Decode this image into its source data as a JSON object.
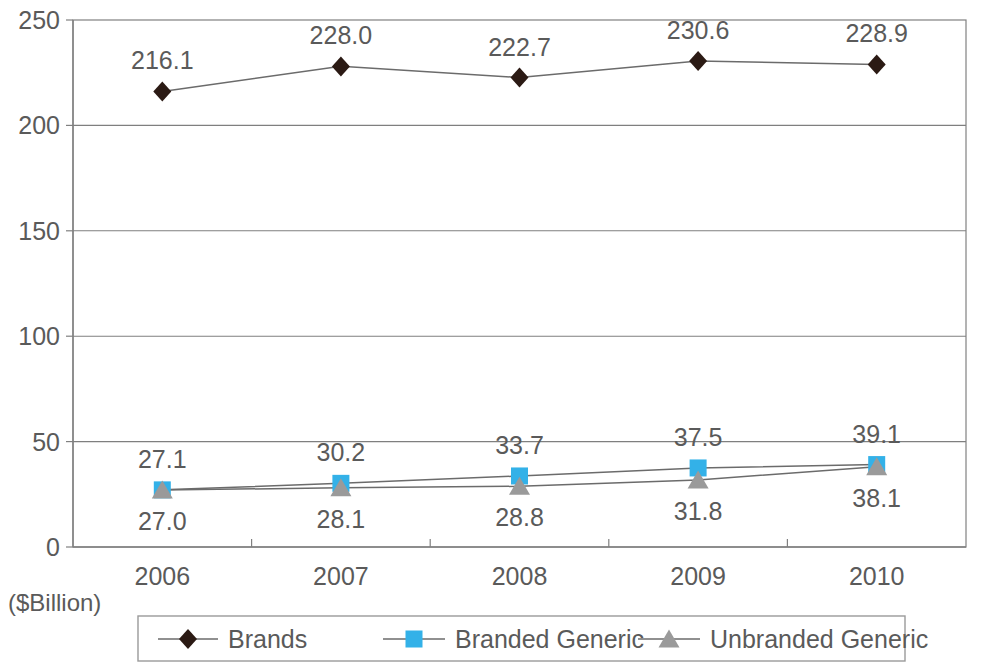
{
  "chart_data": {
    "type": "line",
    "title": "",
    "xlabel": "",
    "ylabel": "",
    "unit_label": "($Billion)",
    "categories": [
      "2006",
      "2007",
      "2008",
      "2009",
      "2010"
    ],
    "ylim": [
      0,
      250
    ],
    "ytick_labels": [
      "0",
      "50",
      "100",
      "150",
      "200",
      "250"
    ],
    "yticks": [
      0,
      50,
      100,
      150,
      200,
      250
    ],
    "grid": "horizontal",
    "legend_position": "bottom",
    "series": [
      {
        "name": "Brands",
        "marker": "diamond",
        "color": "#2b1a14",
        "label_position": "above",
        "values": [
          216.1,
          228.0,
          222.7,
          230.6,
          228.9
        ],
        "value_labels": [
          "216.1",
          "228.0",
          "222.7",
          "230.6",
          "228.9"
        ]
      },
      {
        "name": "Branded Generic",
        "marker": "square",
        "color": "#33b1e8",
        "label_position": "above",
        "values": [
          27.1,
          30.2,
          33.7,
          37.5,
          39.1
        ],
        "value_labels": [
          "27.1",
          "30.2",
          "33.7",
          "37.5",
          "39.1"
        ]
      },
      {
        "name": "Unbranded Generic",
        "marker": "triangle",
        "color": "#9a9a9a",
        "label_position": "below",
        "values": [
          27.0,
          28.1,
          28.8,
          31.8,
          38.1
        ],
        "value_labels": [
          "27.0",
          "28.1",
          "28.8",
          "31.8",
          "38.1"
        ]
      }
    ]
  },
  "axis": {
    "y_ticks": [
      {
        "label": "250"
      },
      {
        "label": "200"
      },
      {
        "label": "150"
      },
      {
        "label": "100"
      },
      {
        "label": "50"
      },
      {
        "label": "0"
      }
    ],
    "x_ticks": [
      {
        "label": "2006"
      },
      {
        "label": "2007"
      },
      {
        "label": "2008"
      },
      {
        "label": "2009"
      },
      {
        "label": "2010"
      }
    ],
    "unit": "($Billion)"
  },
  "legend": {
    "items": [
      {
        "label": "Brands",
        "marker": "diamond",
        "color": "#2b1a14"
      },
      {
        "label": "Branded Generic",
        "marker": "square",
        "color": "#33b1e8"
      },
      {
        "label": "Unbranded Generic",
        "marker": "triangle",
        "color": "#9a9a9a"
      }
    ]
  },
  "value_labels": {
    "brands": [
      "216.1",
      "228.0",
      "222.7",
      "230.6",
      "228.9"
    ],
    "branded_generic": [
      "27.1",
      "30.2",
      "33.7",
      "37.5",
      "39.1"
    ],
    "unbranded_generic": [
      "27.0",
      "28.1",
      "28.8",
      "31.8",
      "38.1"
    ]
  }
}
